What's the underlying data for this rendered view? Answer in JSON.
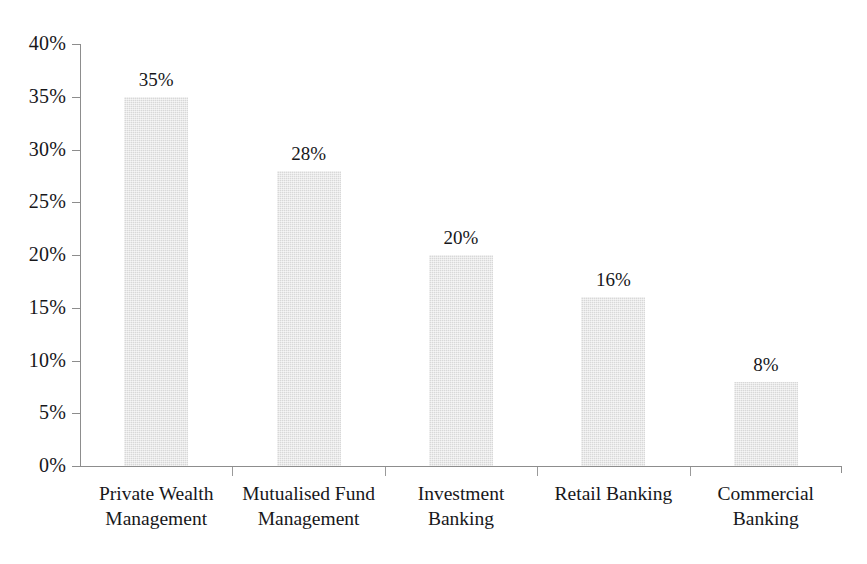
{
  "chart_data": {
    "type": "bar",
    "title": "",
    "subtitle": "",
    "xlabel": "",
    "ylabel": "",
    "categories": [
      "Private Wealth Management",
      "Mutualised Fund Management",
      "Investment Banking",
      "Retail Banking",
      "Commercial Banking"
    ],
    "category_lines": [
      [
        "Private Wealth",
        "Management"
      ],
      [
        "Mutualised Fund",
        "Management"
      ],
      [
        "Investment",
        "Banking"
      ],
      [
        "Retail Banking"
      ],
      [
        "Commercial",
        "Banking"
      ]
    ],
    "values": [
      35,
      28,
      20,
      16,
      8
    ],
    "value_labels": [
      "35%",
      "28%",
      "20%",
      "16%",
      "8%"
    ],
    "ylim": [
      0,
      40
    ],
    "ytick_values": [
      0,
      5,
      10,
      15,
      20,
      25,
      30,
      35,
      40
    ],
    "ytick_labels": [
      "0%",
      "5%",
      "10%",
      "15%",
      "20%",
      "25%",
      "30%",
      "35%",
      "40%"
    ],
    "grid": false,
    "legend": null,
    "bar_color": "#d8d8d8",
    "axis_color": "#8d8d8d",
    "text_color": "#17171a",
    "background": "#ffffff"
  }
}
